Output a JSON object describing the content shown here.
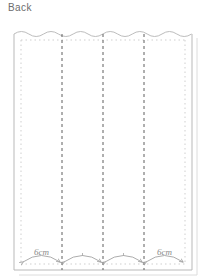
{
  "page": {
    "title": "Back",
    "background_color": "#ffffff"
  },
  "diagram": {
    "name": "back-panel-pattern",
    "type": "sewing-pattern-schematic",
    "outline_color": "#b9b9b9",
    "seam_line_color": "#cfcfcf",
    "fold_line_color": "#5a5a5a",
    "measure_color": "#9a9a9a",
    "frame": {
      "left": 14,
      "top": 33,
      "right": 192,
      "bottom": 270,
      "shadow_offset": 5
    },
    "top_edge": {
      "style": "scalloped",
      "scallop_count": 12,
      "amplitude": 3
    },
    "seam_inset": {
      "left": 21,
      "right": 185,
      "top": 40,
      "bottom": 264
    },
    "fold_lines": [
      {
        "name": "fold-line-1",
        "x": 62
      },
      {
        "name": "fold-line-2",
        "x": 103
      },
      {
        "name": "fold-line-3",
        "x": 144
      }
    ],
    "measurements": [
      {
        "name": "measure-segment-1",
        "from_x": 21,
        "to_x": 62,
        "label": "6cm",
        "show_label": true
      },
      {
        "name": "measure-segment-2",
        "from_x": 62,
        "to_x": 103,
        "label": "",
        "show_label": false
      },
      {
        "name": "measure-segment-3",
        "from_x": 103,
        "to_x": 144,
        "label": "",
        "show_label": false
      },
      {
        "name": "measure-segment-4",
        "from_x": 144,
        "to_x": 185,
        "label": "6cm",
        "show_label": true
      }
    ],
    "measure_baseline_y": 264,
    "measure_arc_peak_y": 252
  }
}
